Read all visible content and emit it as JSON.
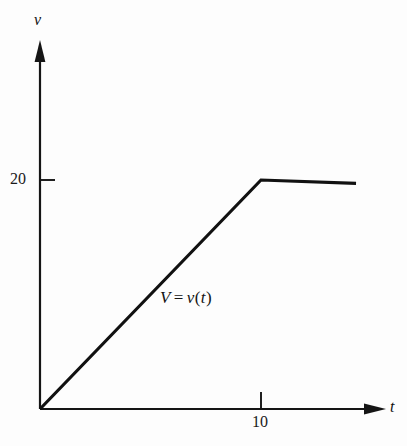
{
  "figure": {
    "background_color": "#fdfdfd",
    "ink_color": "#111111",
    "width": 407,
    "height": 446
  },
  "axes": {
    "y": {
      "name": "v",
      "arrow": "up-arrow-icon",
      "origin_px": {
        "x": 40,
        "y": 409
      },
      "tip_px": {
        "x": 40,
        "y": 42
      },
      "ticks": [
        {
          "value": 20,
          "label": "20",
          "y_px": 180
        }
      ]
    },
    "x": {
      "name": "t",
      "arrow": "right-arrow-icon",
      "origin_px": {
        "x": 40,
        "y": 409
      },
      "tip_px": {
        "x": 384,
        "y": 409
      },
      "ticks": [
        {
          "value": 10,
          "label": "10",
          "x_px": 261
        }
      ]
    }
  },
  "annotations": {
    "curve_equation": {
      "lhs": "V",
      "operator": "=",
      "rhs_function": "v",
      "rhs_open": "(",
      "rhs_arg": "t",
      "rhs_close": ")",
      "full_text": "V = v(t)"
    }
  },
  "chart_data": {
    "type": "line",
    "title": "",
    "subtitle": "",
    "xlabel": "t",
    "ylabel": "v",
    "grid": false,
    "legend": null,
    "legend_position": "none",
    "xlim": [
      0,
      14.3
    ],
    "ylim": [
      0,
      41
    ],
    "xticks": [
      10
    ],
    "xticklabels": [
      "10"
    ],
    "yticks": [
      20
    ],
    "yticklabels": [
      "20"
    ],
    "series": [
      {
        "name": "V = v(t)",
        "color": "#111111",
        "linewidth": 3,
        "x": [
          0,
          10,
          14.3
        ],
        "y": [
          0,
          20,
          19.7
        ],
        "description": "Piecewise linear: rises linearly from the origin (0,0) to (10,20), then remains essentially constant at v = 20 for t > 10."
      }
    ],
    "annotations": [
      {
        "text": "V = v(t)",
        "x": 5.0,
        "y": 6.6
      }
    ]
  }
}
